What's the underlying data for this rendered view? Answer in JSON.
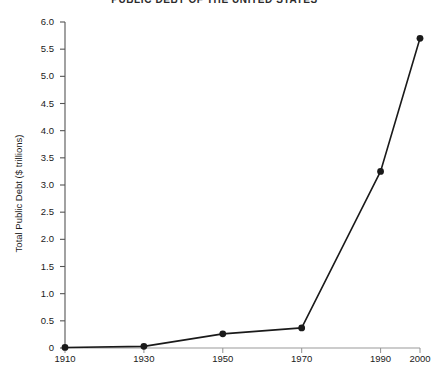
{
  "chart_data": {
    "type": "line",
    "title": "PUBLIC DEBT OF THE UNITED STATES",
    "xlabel": "",
    "ylabel": "Total Public Debt ($ trillions)",
    "x": [
      1910,
      1930,
      1950,
      1970,
      1990,
      2000
    ],
    "values": [
      0.01,
      0.03,
      0.26,
      0.37,
      3.25,
      5.7
    ],
    "categories": [
      "1910",
      "1930",
      "1950",
      "1970",
      "1990",
      "2000"
    ],
    "xlim": [
      1910,
      2000
    ],
    "ylim": [
      0,
      6.0
    ],
    "x_ticks": [
      1910,
      1930,
      1950,
      1970,
      1990,
      2000
    ],
    "x_tick_labels": [
      "1910",
      "1930",
      "1950",
      "1970",
      "1990",
      "2000"
    ],
    "y_ticks": [
      0,
      0.5,
      1.0,
      1.5,
      2.0,
      2.5,
      3.0,
      3.5,
      4.0,
      4.5,
      5.0,
      5.5,
      6.0
    ],
    "y_tick_labels": [
      "0",
      "0.5",
      "1.0",
      "1.5",
      "2.0",
      "2.5",
      "3.0",
      "3.5",
      "4.0",
      "4.5",
      "5.0",
      "5.5",
      "6.0"
    ],
    "grid": false,
    "legend": false,
    "legend_position": "none",
    "marker": "filled-circle",
    "line_color": "#1a1a1a",
    "marker_color": "#1a1a1a",
    "background_color": "#ffffff",
    "series": [
      {
        "name": "Total Public Debt",
        "points": [
          {
            "x": 1910,
            "y": 0.01
          },
          {
            "x": 1930,
            "y": 0.03
          },
          {
            "x": 1950,
            "y": 0.26
          },
          {
            "x": 1970,
            "y": 0.37
          },
          {
            "x": 1990,
            "y": 3.25
          },
          {
            "x": 2000,
            "y": 5.7
          }
        ]
      }
    ]
  }
}
